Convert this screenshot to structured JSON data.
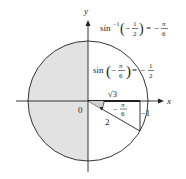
{
  "diagram": {
    "type": "unit-circle-triangle",
    "colors": {
      "stroke": "#231f20",
      "shade": "#e2e2e2",
      "background": "#ffffff"
    },
    "axes": {
      "x_label": "x",
      "y_label": "y",
      "origin_label": "0"
    },
    "equations": {
      "inverse": {
        "lhs_func": "sin",
        "lhs_sup": "−1",
        "lhs_minus": "−",
        "lhs_num": "1",
        "lhs_den": "2",
        "eq": "=",
        "rhs_minus": "−",
        "rhs_num": "π",
        "rhs_den": "6"
      },
      "forward": {
        "lhs_func": "sin",
        "lhs_minus": "−",
        "lhs_num": "π",
        "lhs_den": "6",
        "eq": "=",
        "rhs_minus": "−",
        "rhs_num": "1",
        "rhs_den": "2"
      }
    },
    "triangle": {
      "adjacent_label": "√3",
      "hypotenuse_label": "2",
      "opposite_label": "−1",
      "angle_minus": "−",
      "angle_num": "π",
      "angle_den": "6"
    }
  }
}
